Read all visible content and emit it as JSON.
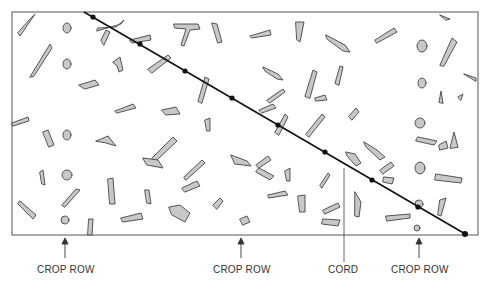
{
  "figure": {
    "frame": {
      "x": 12,
      "y": 12,
      "width": 466,
      "height": 223,
      "stroke": "#555555"
    },
    "cord": {
      "label": "CORD",
      "line": {
        "x1": 84,
        "y1": 12,
        "x2": 467,
        "y2": 235
      },
      "stroke": "#111111",
      "knots": [
        [
          93,
          17
        ],
        [
          140,
          44
        ],
        [
          185,
          71
        ],
        [
          232,
          98
        ],
        [
          278,
          125
        ],
        [
          325,
          152
        ],
        [
          372,
          180
        ],
        [
          418,
          207
        ],
        [
          465,
          234
        ]
      ],
      "leader": {
        "x": 344,
        "y1": 168,
        "y2": 262
      }
    },
    "labels": [
      {
        "id": "crop-row-1",
        "text": "CROP ROW",
        "x": 37,
        "y": 264,
        "arrow_x": 65
      },
      {
        "id": "crop-row-2",
        "text": "CROP ROW",
        "x": 213,
        "y": 264,
        "arrow_x": 241
      },
      {
        "id": "cord",
        "text": "CORD",
        "x": 328,
        "y": 264
      },
      {
        "id": "crop-row-3",
        "text": "CROP ROW",
        "x": 391,
        "y": 264,
        "arrow_x": 419
      }
    ],
    "residue_fill": "#c8c8c8",
    "residue_stroke": "#444444",
    "caption": "Figure 10.10 Crop residue cover measurement using the line-transect (cord) method"
  }
}
